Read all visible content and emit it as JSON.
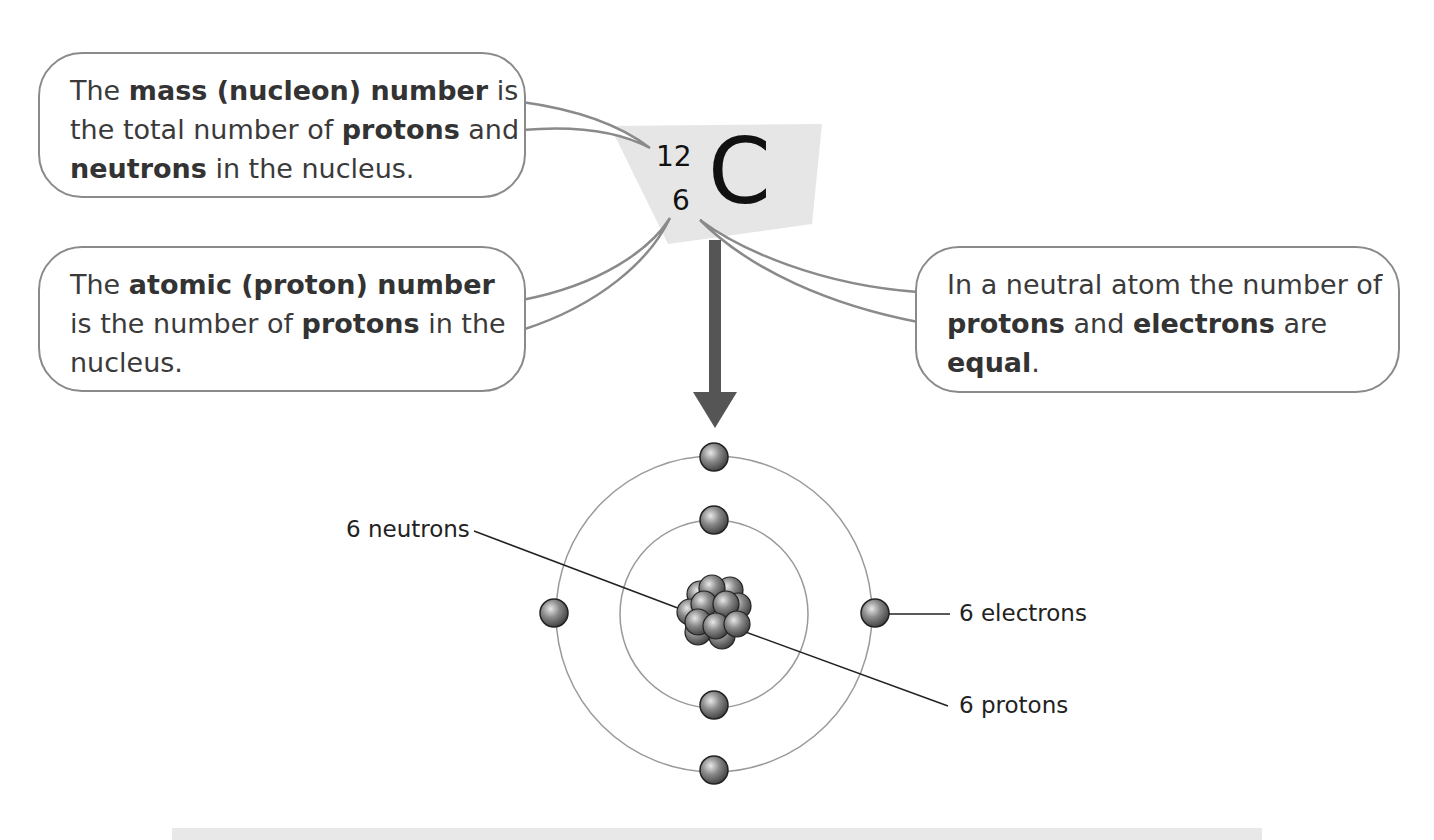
{
  "element": {
    "symbol": "C",
    "mass_number": "12",
    "atomic_number": "6"
  },
  "callouts": {
    "mass": {
      "parts": [
        {
          "text": "The ",
          "bold": false
        },
        {
          "text": "mass (nucleon) number",
          "bold": true
        },
        {
          "text": " is the total number of ",
          "bold": false
        },
        {
          "text": "protons",
          "bold": true
        },
        {
          "text": " and ",
          "bold": false
        },
        {
          "text": "neutrons",
          "bold": true
        },
        {
          "text": " in the nucleus.",
          "bold": false
        }
      ]
    },
    "atomic": {
      "parts": [
        {
          "text": "The ",
          "bold": false
        },
        {
          "text": "atomic (proton) number",
          "bold": true
        },
        {
          "text": " is the number of ",
          "bold": false
        },
        {
          "text": "protons",
          "bold": true
        },
        {
          "text": " in the nucleus.",
          "bold": false
        }
      ]
    },
    "neutral": {
      "parts": [
        {
          "text": "In a neutral atom the number of ",
          "bold": false
        },
        {
          "text": "protons",
          "bold": true
        },
        {
          "text": " and ",
          "bold": false
        },
        {
          "text": "electrons",
          "bold": true
        },
        {
          "text": " are ",
          "bold": false
        },
        {
          "text": "equal",
          "bold": true
        },
        {
          "text": ".",
          "bold": false
        }
      ]
    }
  },
  "atom_labels": {
    "neutrons": "6 neutrons",
    "electrons": "6 electrons",
    "protons": "6 protons"
  },
  "colors": {
    "bubble_border": "#8a8a8a",
    "arrow": "#555555",
    "symbol_bg": "#e6e6e6",
    "orbit": "#9a9a9a"
  }
}
